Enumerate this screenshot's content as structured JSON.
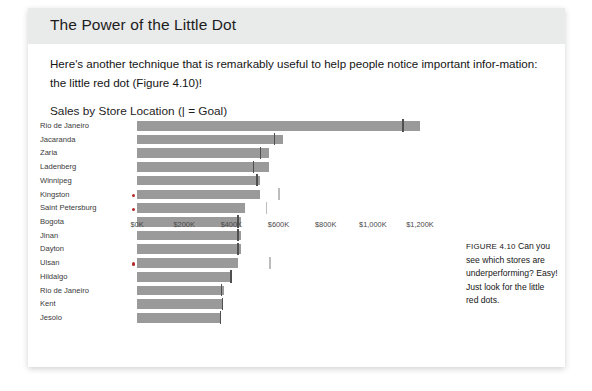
{
  "page": {
    "title": "The Power of the Little Dot",
    "body_paragraph": "Here's another technique that is remarkably useful to help people notice important infor-mation: the little red dot (Figure 4.10)!",
    "figure_caption_label": "FIGURE 4.10",
    "figure_caption_text": "Can you see which stores are underperforming? Easy! Just look for the little red dots."
  },
  "colors": {
    "bar": "#9a9a9a",
    "goal_marker": "#4f4f4f",
    "goal_marker_faint": "#bdbdbd",
    "dot": "#b02a2a",
    "header_band": "#e9eaea",
    "text": "#1d1d1d"
  },
  "chart_data": {
    "type": "bar",
    "orientation": "horizontal",
    "title": "Sales by Store Location (| = Goal)",
    "xlabel": "",
    "ylabel": "",
    "xlim": [
      0,
      1250
    ],
    "grid": false,
    "legend": "| = Goal",
    "tick_labels": [
      "$0K",
      "$200K",
      "$400K",
      "$600K",
      "$800K",
      "$1,000K",
      "$1,200K"
    ],
    "tick_values": [
      0,
      200,
      400,
      600,
      800,
      1000,
      1200
    ],
    "categories": [
      "Rio de Janeiro",
      "Jacaranda",
      "Zaria",
      "Ladenberg",
      "Winnipeg",
      "Kingston",
      "Saint Petersburg",
      "Bogota",
      "Jinan",
      "Dayton",
      "Ulsan",
      "Hildalgo",
      "Rio de Janeiro",
      "Kent",
      "Jesolo"
    ],
    "series": [
      {
        "name": "Sales",
        "values": [
          1200,
          620,
          560,
          560,
          520,
          520,
          460,
          440,
          440,
          440,
          430,
          400,
          370,
          360,
          355
        ]
      },
      {
        "name": "Goal",
        "values": [
          1125,
          580,
          520,
          490,
          505,
          500,
          490,
          425,
          425,
          425,
          500,
          395,
          355,
          360,
          350
        ]
      }
    ],
    "underperforming_flags": [
      false,
      false,
      false,
      false,
      false,
      true,
      true,
      false,
      false,
      false,
      true,
      false,
      false,
      false,
      false
    ],
    "rows": [
      {
        "label": "Rio de Janeiro",
        "value": 1200,
        "goal": 1125,
        "goal_faint": false,
        "dot": false
      },
      {
        "label": "Jacaranda",
        "value": 620,
        "goal": 580,
        "goal_faint": false,
        "dot": false
      },
      {
        "label": "Zaria",
        "value": 560,
        "goal": 520,
        "goal_faint": false,
        "dot": false
      },
      {
        "label": "Ladenberg",
        "value": 560,
        "goal": 490,
        "goal_faint": false,
        "dot": false
      },
      {
        "label": "Winnipeg",
        "value": 520,
        "goal": 505,
        "goal_faint": false,
        "dot": false
      },
      {
        "label": "Kingston",
        "value": 520,
        "goal": 600,
        "goal_faint": true,
        "dot": true
      },
      {
        "label": "Saint Petersburg",
        "value": 460,
        "goal": 545,
        "goal_faint": true,
        "dot": true
      },
      {
        "label": "Bogota",
        "value": 440,
        "goal": 425,
        "goal_faint": false,
        "dot": false
      },
      {
        "label": "Jinan",
        "value": 440,
        "goal": 425,
        "goal_faint": false,
        "dot": false
      },
      {
        "label": "Dayton",
        "value": 440,
        "goal": 425,
        "goal_faint": false,
        "dot": false
      },
      {
        "label": "Ulsan",
        "value": 430,
        "goal": 560,
        "goal_faint": true,
        "dot": true
      },
      {
        "label": "Hildalgo",
        "value": 400,
        "goal": 395,
        "goal_faint": false,
        "dot": false
      },
      {
        "label": "Rio de Janeiro",
        "value": 370,
        "goal": 355,
        "goal_faint": false,
        "dot": false
      },
      {
        "label": "Kent",
        "value": 360,
        "goal": 360,
        "goal_faint": false,
        "dot": false
      },
      {
        "label": "Jesolo",
        "value": 355,
        "goal": 350,
        "goal_faint": false,
        "dot": false
      }
    ]
  }
}
